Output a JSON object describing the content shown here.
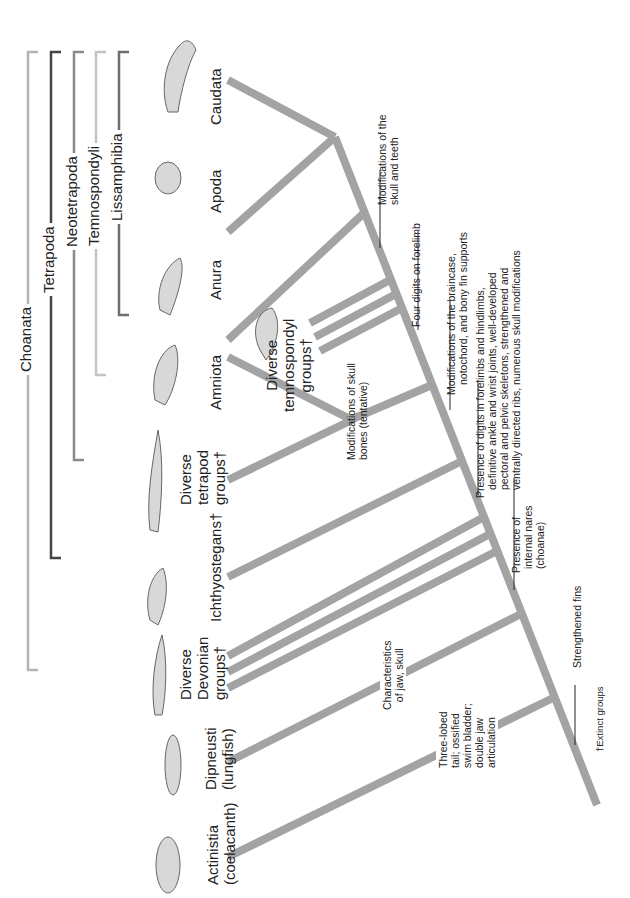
{
  "figure": {
    "branch_color": "#a3a3a3",
    "footnote": "†Extinct groups"
  },
  "clades": [
    {
      "label": "Choanata",
      "color": "#b3b3b3"
    },
    {
      "label": "Tetrapoda",
      "color": "#444444"
    },
    {
      "label": "Neotetrapoda",
      "color": "#8a8a8a"
    },
    {
      "label": "Temnospondyli",
      "color": "#c4c4c4"
    },
    {
      "label": "Lissamphibia",
      "color": "#6e6e6e"
    }
  ],
  "taxa": [
    {
      "line1": "Actinistia",
      "line2": "(coelacanth)"
    },
    {
      "line1": "Dipneusti",
      "line2": "(lungfish)"
    },
    {
      "line1": "Diverse",
      "line2": "Devonian",
      "line3": "groups†"
    },
    {
      "line1": "Ichthyostegans†"
    },
    {
      "line1": "Diverse",
      "line2": "tetrapod",
      "line3": "groups†"
    },
    {
      "line1": "Amniota"
    },
    {
      "line1": "Diverse",
      "line2": "temnospondyl",
      "line3": "groups†"
    },
    {
      "line1": "Anura"
    },
    {
      "line1": "Apoda"
    },
    {
      "line1": "Caudata"
    }
  ],
  "characters": [
    {
      "line1": "Modifications of the",
      "line2": "skull and teeth"
    },
    {
      "line1": "Four digits on forelimb"
    },
    {
      "line1": "Modifications of the braincase,",
      "line2": "notochord, and bony fin supports"
    },
    {
      "line1": "Presence of digits in forelimbs and hindlimbs,",
      "line2": "definitive ankle and wrist joints, well-developed",
      "line3": "pectoral and pelvic skeletons, strengthened and",
      "line4": "ventrally directed ribs, numerous skull modifications"
    },
    {
      "line1": "Modifications of skull",
      "line2": "bones (tentative)"
    },
    {
      "line1": "Presence of",
      "line2": "internal nares",
      "line3": "(choanae)"
    },
    {
      "line1": "Characteristics",
      "line2": "of jaw, skull"
    },
    {
      "line1": "Three-lobed",
      "line2": "tail; ossified",
      "line3": "swim bladder;",
      "line4": "double jaw",
      "line5": "articulation"
    },
    {
      "line1": "Strengthened fins"
    }
  ]
}
